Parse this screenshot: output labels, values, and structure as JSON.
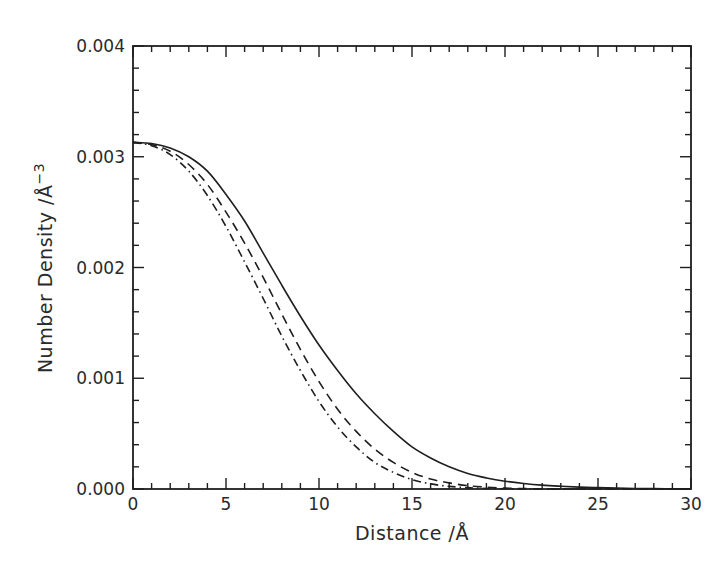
{
  "chart_data": {
    "type": "line",
    "title": "",
    "xlabel": "Distance /Å",
    "ylabel": "Number Density /Å",
    "ylabel_superscript": "−3",
    "xlim": [
      0,
      30
    ],
    "ylim": [
      0,
      0.004
    ],
    "grid": false,
    "legend": null,
    "x_ticks": [
      0,
      5,
      10,
      15,
      20,
      25,
      30
    ],
    "x_tick_labels": [
      "0",
      "5",
      "10",
      "15",
      "20",
      "25",
      "30"
    ],
    "x_minor_step": 1,
    "y_ticks": [
      0,
      0.001,
      0.002,
      0.003,
      0.004
    ],
    "y_tick_labels": [
      "0.000",
      "0.001",
      "0.002",
      "0.003",
      "0.004"
    ],
    "y_minor_step": 0.0002,
    "x": [
      0,
      1,
      2,
      3,
      4,
      5,
      6,
      7,
      8,
      9,
      10,
      11,
      12,
      13,
      14,
      15,
      16,
      17,
      18,
      19,
      20,
      21,
      22,
      23,
      24,
      25,
      26,
      27,
      28,
      29,
      30
    ],
    "series": [
      {
        "name": "solid",
        "style": "solid",
        "values": [
          0.00313,
          0.00312,
          0.00308,
          0.003,
          0.00287,
          0.00266,
          0.00242,
          0.00213,
          0.00184,
          0.00156,
          0.0013,
          0.00107,
          0.00086,
          0.00068,
          0.00052,
          0.00038,
          0.00028,
          0.0002,
          0.00014,
          0.0001,
          7e-05,
          5e-05,
          3.5e-05,
          2.5e-05,
          1.7e-05,
          1.2e-05,
          8e-06,
          5e-06,
          3e-06,
          2e-06,
          1e-06
        ]
      },
      {
        "name": "dashed",
        "style": "dashed",
        "values": [
          0.00313,
          0.00311,
          0.00305,
          0.00293,
          0.00275,
          0.0025,
          0.00222,
          0.00191,
          0.00158,
          0.00126,
          0.00097,
          0.00072,
          0.00052,
          0.00036,
          0.00024,
          0.00015,
          9e-05,
          5.5e-05,
          3e-05,
          1.6e-05,
          8e-06,
          4e-06,
          2e-06,
          1e-06,
          0,
          0,
          0,
          0,
          0,
          0,
          0
        ]
      },
      {
        "name": "dash-dot",
        "style": "dash-dot",
        "values": [
          0.00313,
          0.0031,
          0.00302,
          0.00287,
          0.00265,
          0.00237,
          0.00205,
          0.00172,
          0.00138,
          0.00107,
          0.00079,
          0.00056,
          0.00038,
          0.00024,
          0.00015,
          8.5e-05,
          4.6e-05,
          2.4e-05,
          1.2e-05,
          5e-06,
          2e-06,
          0,
          0,
          0,
          0,
          0,
          0,
          0,
          0,
          0,
          0
        ]
      }
    ]
  },
  "colors": {
    "line": "#1e1e1e",
    "axis": "#1e1e1e",
    "background": "#ffffff"
  }
}
